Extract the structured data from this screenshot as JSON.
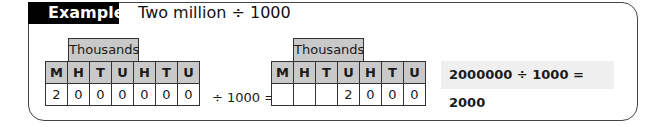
{
  "example": {
    "tab_label": "Example",
    "title": "Two million ÷ 1000"
  },
  "left_table": {
    "group_header": "Thousands",
    "columns": [
      "M",
      "H",
      "T",
      "U",
      "H",
      "T",
      "U"
    ],
    "values": [
      "2",
      "0",
      "0",
      "0",
      "0",
      "0",
      "0"
    ]
  },
  "operation": {
    "text": "÷ 1000 ="
  },
  "right_table": {
    "group_header": "Thousands",
    "columns": [
      "M",
      "H",
      "T",
      "U",
      "H",
      "T",
      "U"
    ],
    "values": [
      "",
      "",
      "",
      "2",
      "0",
      "0",
      "0"
    ]
  },
  "answer": {
    "text": "2000000 ÷ 1000 = 2000"
  },
  "colors": {
    "header_fill": "#c9c9c9",
    "tab_fill": "#000000",
    "answer_fill": "#efefef",
    "border": "#444444"
  }
}
